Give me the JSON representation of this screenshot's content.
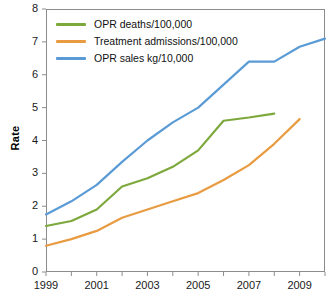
{
  "chart_data": {
    "type": "line",
    "title": "",
    "xlabel": "",
    "ylabel": "Rate",
    "xlim": [
      1999,
      2010
    ],
    "ylim": [
      0,
      8
    ],
    "grid": false,
    "legend_position": "top-left",
    "x": [
      1999,
      2000,
      2001,
      2002,
      2003,
      2004,
      2005,
      2006,
      2007,
      2008,
      2009,
      2010
    ],
    "x_tick_labels": [
      "1999",
      "",
      "2001",
      "",
      "2003",
      "",
      "2005",
      "",
      "2007",
      "",
      "2009",
      ""
    ],
    "x_ticks_all": [
      1999,
      2000,
      2001,
      2002,
      2003,
      2004,
      2005,
      2006,
      2007,
      2008,
      2009,
      2010
    ],
    "x_labeled_ticks": [
      "1999",
      "2001",
      "2003",
      "2005",
      "2007",
      "2009"
    ],
    "y_ticks": [
      0,
      1,
      2,
      3,
      4,
      5,
      6,
      7,
      8
    ],
    "y_tick_labels": [
      "0",
      "1",
      "2",
      "3",
      "4",
      "5",
      "6",
      "7",
      "8"
    ],
    "series": [
      {
        "name": "OPR deaths/100,000",
        "color": "#7DA83C",
        "x": [
          1999,
          2000,
          2001,
          2002,
          2003,
          2004,
          2005,
          2006,
          2007,
          2008
        ],
        "values": [
          1.4,
          1.55,
          1.9,
          2.6,
          2.85,
          3.2,
          3.7,
          4.6,
          4.7,
          4.82
        ]
      },
      {
        "name": "Treatment admissions/100,000",
        "color": "#E89B40",
        "x": [
          1999,
          2000,
          2001,
          2002,
          2003,
          2004,
          2005,
          2006,
          2007,
          2008,
          2009
        ],
        "values": [
          0.8,
          1.0,
          1.25,
          1.65,
          1.9,
          2.15,
          2.4,
          2.8,
          3.25,
          3.9,
          4.65
        ]
      },
      {
        "name": "OPR sales kg/10,000",
        "color": "#5B9BD5",
        "x": [
          1999,
          2000,
          2001,
          2002,
          2003,
          2004,
          2005,
          2006,
          2007,
          2008,
          2009,
          2010
        ],
        "values": [
          1.75,
          2.15,
          2.65,
          3.35,
          4.0,
          4.55,
          5.0,
          5.7,
          6.4,
          6.4,
          6.85,
          7.1
        ]
      }
    ]
  },
  "axis": {
    "y_title": "Rate"
  },
  "legend": {
    "entries": [
      {
        "label": "OPR deaths/100,000",
        "color": "#7DA83C"
      },
      {
        "label": "Treatment admissions/100,000",
        "color": "#E89B40"
      },
      {
        "label": "OPR sales kg/10,000",
        "color": "#5B9BD5"
      }
    ]
  },
  "style": {
    "frame_color": "#8c8c8c",
    "text_color": "#1a1a1a",
    "background": "#ffffff",
    "line_width": 2.2
  }
}
